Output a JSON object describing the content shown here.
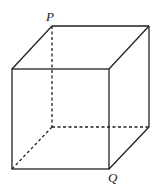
{
  "diagram": {
    "type": "cube",
    "labels": {
      "P": "P",
      "Q": "Q"
    },
    "colors": {
      "stroke": "#222222",
      "background": "#ffffff"
    }
  }
}
